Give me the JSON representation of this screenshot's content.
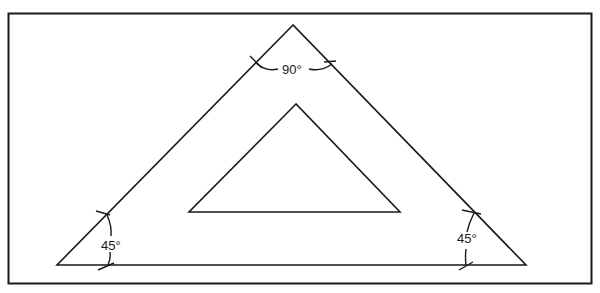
{
  "diagram": {
    "colors": {
      "stroke": "#1a1a1a",
      "background": "#ffffff"
    },
    "outer_triangle": {
      "apex": [
        293,
        25
      ],
      "left": [
        57,
        265
      ],
      "right": [
        526,
        265
      ]
    },
    "inner_triangle": {
      "apex": [
        296,
        104
      ],
      "left": [
        189,
        212
      ],
      "right": [
        400,
        212
      ]
    },
    "angles": {
      "top": {
        "label": "90°"
      },
      "left": {
        "label": "45°"
      },
      "right": {
        "label": "45°"
      }
    }
  }
}
